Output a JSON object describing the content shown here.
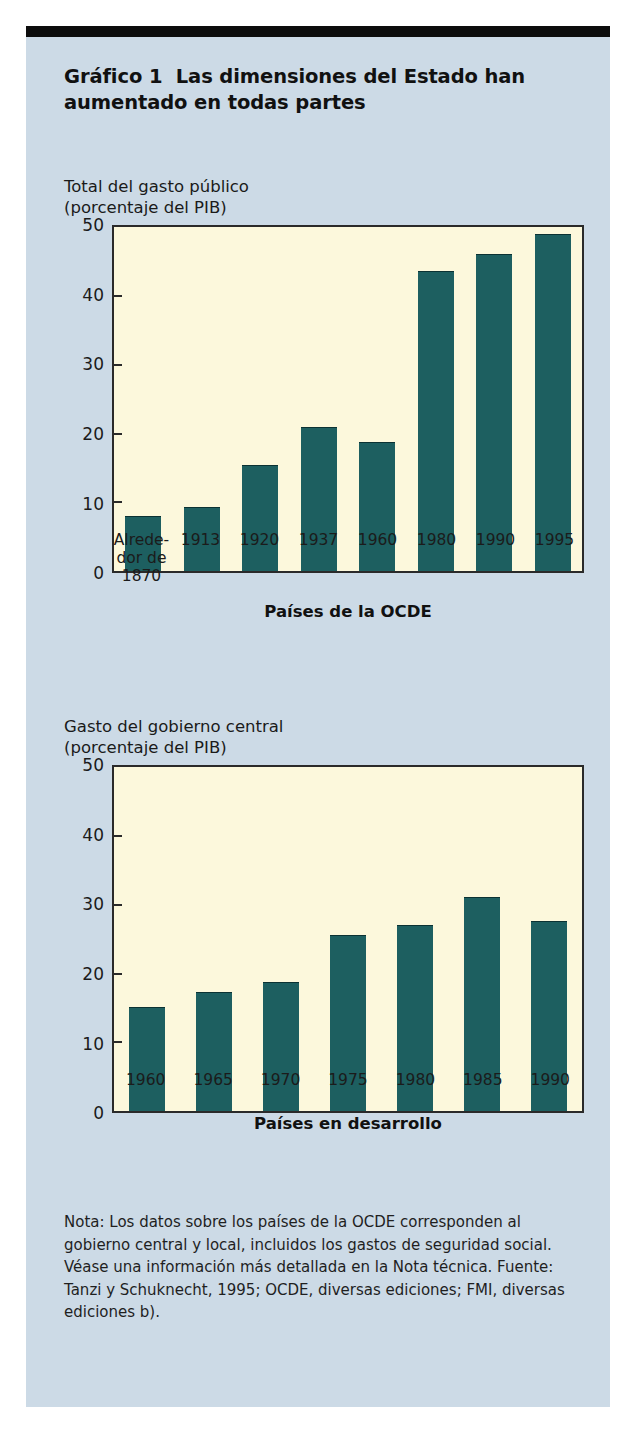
{
  "figure": {
    "label": "Gráfico 1",
    "title": "Las dimensiones del Estado han aumentado en todas partes",
    "note": "Nota: Los datos sobre los países de la OCDE corresponden al gobierno central y local, incluidos los gastos de seguridad social. Véase una información más detallada en la Nota técnica. Fuente: Tanzi y Schuknecht, 1995; OCDE, diversas ediciones; FMI, diversas ediciones b).",
    "colors": {
      "card_background": "#ccdae6",
      "plot_background": "#fcf8dc",
      "bar": "#1d5f60",
      "bar_shadow": "#0a0a0a",
      "rule": "#0d0d0d"
    }
  },
  "chart_data": [
    {
      "type": "bar",
      "title": "Total del gasto público",
      "subtitle": "(porcentaje del PIB)",
      "xlabel": "Países de la OCDE",
      "ylabel": "",
      "ylim": [
        0,
        50
      ],
      "yticks": [
        0,
        10,
        20,
        30,
        40,
        50
      ],
      "grid": false,
      "legend": "none",
      "categories": [
        "Alrede-\ndor de\n1870",
        "1913",
        "1920",
        "1937",
        "1960",
        "1980",
        "1990",
        "1995"
      ],
      "values": [
        8.1,
        9.4,
        15.4,
        21.0,
        18.8,
        43.6,
        46.1,
        49.0
      ]
    },
    {
      "type": "bar",
      "title": "Gasto del gobierno central",
      "subtitle": "(porcentaje del PIB)",
      "xlabel": "Países en desarrollo",
      "ylabel": "",
      "ylim": [
        0,
        50
      ],
      "yticks": [
        0,
        10,
        20,
        30,
        40,
        50
      ],
      "grid": false,
      "legend": "none",
      "categories": [
        "1960",
        "1965",
        "1970",
        "1975",
        "1980",
        "1985",
        "1990"
      ],
      "values": [
        15.1,
        17.3,
        18.8,
        25.6,
        27.0,
        31.2,
        27.6
      ]
    }
  ]
}
